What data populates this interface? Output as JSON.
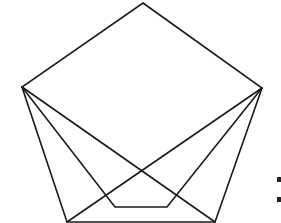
{
  "diagram": {
    "type": "geometric-line-drawing",
    "stroke_color": "#1a1a1a",
    "background": "#ffffff",
    "vertices": {
      "top": [
        143,
        3
      ],
      "left": [
        22,
        87
      ],
      "right": [
        262,
        88
      ],
      "bottom_left": [
        67,
        222
      ],
      "bottom_right": [
        215,
        222
      ]
    },
    "inner_path": [
      [
        22,
        87
      ],
      [
        115,
        207
      ],
      [
        167,
        207
      ],
      [
        262,
        88
      ]
    ],
    "crossing_point": [
      143,
      171
    ],
    "edge_fragment": "partially visible glyph at right edge"
  }
}
